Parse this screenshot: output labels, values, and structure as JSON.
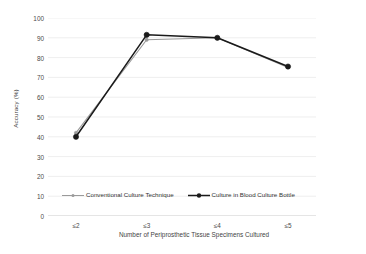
{
  "chart_data": {
    "type": "line",
    "title": "",
    "xlabel": "Number of Periprosthetic Tissue Specimens Cultured",
    "ylabel": "Accuracy (%)",
    "categories": [
      "≤2",
      "≤3",
      "≤4",
      "≤5"
    ],
    "ylim": [
      0,
      100
    ],
    "yticks": [
      0,
      10,
      20,
      30,
      40,
      50,
      60,
      70,
      80,
      90,
      100
    ],
    "ytick_labels": [
      "0",
      "10",
      "20",
      "30",
      "40",
      "50",
      "60",
      "70",
      "80",
      "90",
      "100"
    ],
    "grid": "horizontal",
    "legend_position": "inside-lower-left",
    "series": [
      {
        "name": "Conventional Culture Technique",
        "values": [
          42,
          89,
          90,
          75
        ],
        "color": "#9a9a9a",
        "marker": "circle-small"
      },
      {
        "name": "Culture in Blood Culture Bottle",
        "values": [
          40,
          91.5,
          90,
          75.5
        ],
        "color": "#1a1a1a",
        "marker": "circle-filled"
      }
    ]
  },
  "legend": {
    "entries": [
      {
        "label": "Conventional Culture Technique"
      },
      {
        "label": "Culture in Blood Culture Bottle"
      }
    ]
  }
}
